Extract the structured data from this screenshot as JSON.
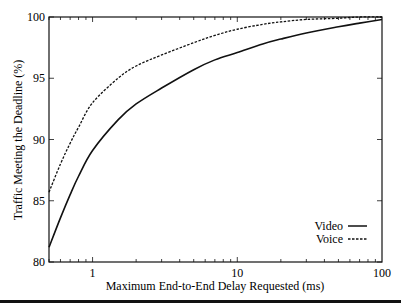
{
  "chart_data": {
    "type": "line",
    "title": "",
    "xlabel": "Maximum End-to-End Delay Requested (ms)",
    "ylabel": "Traffic Meeting the Deadline (%)",
    "xscale": "log",
    "xlim": [
      0.5,
      100
    ],
    "ylim": [
      80,
      100
    ],
    "xticks": [
      1,
      10,
      100
    ],
    "xtick_labels": [
      "1",
      "10",
      "100"
    ],
    "yticks": [
      80,
      85,
      90,
      95,
      100
    ],
    "ytick_labels": [
      "80",
      "85",
      "90",
      "95",
      "100"
    ],
    "grid": false,
    "legend_position": "lower right",
    "series": [
      {
        "name": "Video",
        "style": "solid",
        "x": [
          0.5,
          0.6,
          0.7,
          0.8,
          1,
          1.5,
          2,
          3,
          5,
          7,
          10,
          15,
          20,
          30,
          50,
          70,
          100
        ],
        "values": [
          81.2,
          83.6,
          85.5,
          87.0,
          89.1,
          91.6,
          92.9,
          94.2,
          95.7,
          96.5,
          97.1,
          97.8,
          98.2,
          98.7,
          99.2,
          99.5,
          99.8
        ]
      },
      {
        "name": "Voice",
        "style": "dashed",
        "x": [
          0.5,
          0.6,
          0.7,
          0.8,
          1,
          1.5,
          2,
          3,
          5,
          7,
          10,
          15,
          20,
          30,
          50,
          70,
          100
        ],
        "values": [
          85.7,
          88.0,
          89.7,
          91.0,
          93.0,
          95.0,
          96.0,
          96.9,
          97.9,
          98.5,
          99.0,
          99.4,
          99.6,
          99.8,
          99.9,
          100.0,
          100.0
        ]
      }
    ]
  }
}
